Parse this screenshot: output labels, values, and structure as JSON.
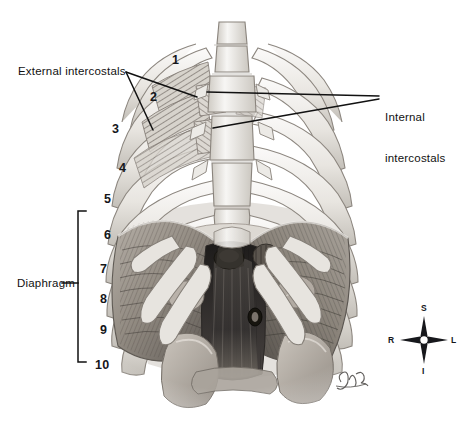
{
  "figure": {
    "background_color": "#ffffff",
    "ink_color": "#111111",
    "width": 462,
    "height": 426
  },
  "callouts": [
    {
      "id": "external-intercostals",
      "label": "External intercostals",
      "x": 18,
      "y": 65,
      "leader_from": [
        126,
        72
      ],
      "leader_to": [
        [
          196,
          96
        ],
        [
          152,
          129
        ]
      ]
    },
    {
      "id": "internal-intercostals",
      "label_line1": "Internal",
      "label_line2": "intercostals",
      "x": 385,
      "y": 84,
      "leader_from": [
        378,
        97
      ],
      "leader_to": [
        [
          208,
          92
        ],
        [
          212,
          127
        ]
      ]
    },
    {
      "id": "diaphragm",
      "label": "Diaphragm",
      "x": 17,
      "y": 277,
      "bracket": {
        "x": 78,
        "top": 211,
        "bottom": 362,
        "tick_y": 283,
        "tick_x1": 62,
        "tick_x2": 78
      }
    }
  ],
  "rib_numbers": [
    {
      "label": "1",
      "x": 172,
      "y": 53
    },
    {
      "label": "2",
      "x": 150,
      "y": 90
    },
    {
      "label": "3",
      "x": 112,
      "y": 122
    },
    {
      "label": "4",
      "x": 119,
      "y": 161
    },
    {
      "label": "5",
      "x": 104,
      "y": 192
    },
    {
      "label": "6",
      "x": 104,
      "y": 228
    },
    {
      "label": "7",
      "x": 100,
      "y": 262
    },
    {
      "label": "8",
      "x": 100,
      "y": 292
    },
    {
      "label": "9",
      "x": 100,
      "y": 323
    },
    {
      "label": "10",
      "x": 95,
      "y": 358
    }
  ],
  "compass": {
    "name": "orientation-compass",
    "center_x": 424,
    "center_y": 340,
    "superior": "S",
    "inferior": "I",
    "right": "R",
    "left": "L"
  },
  "signature": {
    "name": "artist-signature",
    "x": 340,
    "y": 378,
    "text": "Glenn"
  },
  "palette": {
    "bone_light": "#f4f3f1",
    "bone_mid": "#dcd9d4",
    "bone_shadow": "#b9b5ae",
    "muscle_light": "#cfcac3",
    "muscle_mid": "#9d968d",
    "muscle_dark": "#5f5a54",
    "muscle_deep": "#2f2c29",
    "organ": "#b4aea6",
    "outline": "#6b6660"
  }
}
